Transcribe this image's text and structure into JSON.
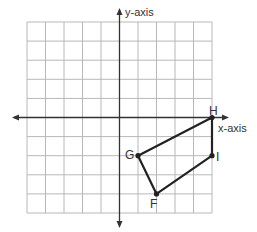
{
  "axes": {
    "x_label": "x-axis",
    "y_label": "y-axis"
  },
  "grid": {
    "columns": 10,
    "rows": 10,
    "x_range": [
      -5,
      5
    ],
    "y_range": [
      -5,
      5
    ]
  },
  "polygon": {
    "vertices": [
      {
        "label": "H",
        "x": 5,
        "y": 0
      },
      {
        "label": "I",
        "x": 5,
        "y": -2
      },
      {
        "label": "F",
        "x": 2,
        "y": -4
      },
      {
        "label": "G",
        "x": 1,
        "y": -2
      }
    ]
  },
  "colors": {
    "grid": "#b8b8b8",
    "axis": "#333333",
    "polygon": "#222222"
  }
}
